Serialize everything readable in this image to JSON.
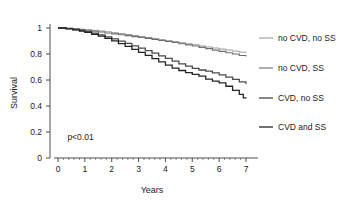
{
  "chart_data": {
    "type": "line",
    "title": "",
    "xlabel": "Years",
    "ylabel": "Survival",
    "xlim": [
      0,
      7.3
    ],
    "ylim": [
      0,
      1.05
    ],
    "grid": false,
    "legend_position": "right",
    "x_ticks": [
      "0",
      "1",
      "2",
      "3",
      "4",
      "5",
      "6",
      "7"
    ],
    "x_tick_values": [
      0,
      1,
      2,
      3,
      4,
      5,
      6,
      7
    ],
    "y_ticks": [
      "0",
      "0.2",
      "0.4",
      "0.6",
      "0.8",
      "1"
    ],
    "y_tick_values": [
      0,
      0.2,
      0.4,
      0.6,
      0.8,
      1
    ],
    "annotations": [
      {
        "text": "p<0.01",
        "x": 0.35,
        "y": 0.135
      }
    ],
    "series": [
      {
        "name": "no CVD, no SS",
        "color": "#9a9a9a",
        "width": 1.0,
        "final_value": 0.81,
        "points": [
          [
            0.0,
            1.0
          ],
          [
            0.3,
            0.998
          ],
          [
            0.55,
            0.995
          ],
          [
            0.8,
            0.991
          ],
          [
            1.0,
            0.987
          ],
          [
            1.25,
            0.982
          ],
          [
            1.5,
            0.977
          ],
          [
            1.75,
            0.971
          ],
          [
            2.0,
            0.964
          ],
          [
            2.25,
            0.957
          ],
          [
            2.5,
            0.95
          ],
          [
            2.75,
            0.943
          ],
          [
            3.0,
            0.935
          ],
          [
            3.25,
            0.927
          ],
          [
            3.5,
            0.919
          ],
          [
            3.75,
            0.911
          ],
          [
            4.0,
            0.903
          ],
          [
            4.25,
            0.895
          ],
          [
            4.5,
            0.887
          ],
          [
            4.75,
            0.879
          ],
          [
            5.0,
            0.871
          ],
          [
            5.25,
            0.862
          ],
          [
            5.5,
            0.854
          ],
          [
            5.75,
            0.846
          ],
          [
            6.0,
            0.838
          ],
          [
            6.25,
            0.83
          ],
          [
            6.5,
            0.822
          ],
          [
            6.75,
            0.814
          ],
          [
            7.0,
            0.81
          ]
        ]
      },
      {
        "name": "no CVD, SS",
        "color": "#6e6e6e",
        "width": 1.1,
        "final_value": 0.78,
        "points": [
          [
            0.0,
            1.0
          ],
          [
            0.3,
            0.997
          ],
          [
            0.55,
            0.993
          ],
          [
            0.8,
            0.988
          ],
          [
            1.0,
            0.983
          ],
          [
            1.25,
            0.976
          ],
          [
            1.5,
            0.969
          ],
          [
            1.75,
            0.962
          ],
          [
            2.0,
            0.955
          ],
          [
            2.25,
            0.948
          ],
          [
            2.5,
            0.941
          ],
          [
            2.75,
            0.934
          ],
          [
            3.0,
            0.927
          ],
          [
            3.25,
            0.92
          ],
          [
            3.5,
            0.912
          ],
          [
            3.75,
            0.904
          ],
          [
            4.0,
            0.896
          ],
          [
            4.25,
            0.888
          ],
          [
            4.5,
            0.879
          ],
          [
            4.75,
            0.87
          ],
          [
            5.0,
            0.861
          ],
          [
            5.25,
            0.851
          ],
          [
            5.5,
            0.841
          ],
          [
            5.75,
            0.83
          ],
          [
            6.0,
            0.82
          ],
          [
            6.25,
            0.81
          ],
          [
            6.5,
            0.8
          ],
          [
            6.75,
            0.789
          ],
          [
            7.0,
            0.78
          ]
        ]
      },
      {
        "name": "CVD, no SS",
        "color": "#4a4a4a",
        "width": 1.3,
        "final_value": 0.57,
        "points": [
          [
            0.0,
            1.0
          ],
          [
            0.3,
            0.995
          ],
          [
            0.55,
            0.988
          ],
          [
            0.8,
            0.98
          ],
          [
            1.0,
            0.972
          ],
          [
            1.25,
            0.96
          ],
          [
            1.5,
            0.947
          ],
          [
            1.75,
            0.932
          ],
          [
            2.0,
            0.916
          ],
          [
            2.25,
            0.899
          ],
          [
            2.5,
            0.881
          ],
          [
            2.75,
            0.863
          ],
          [
            3.0,
            0.845
          ],
          [
            3.25,
            0.826
          ],
          [
            3.5,
            0.806
          ],
          [
            3.75,
            0.786
          ],
          [
            4.0,
            0.766
          ],
          [
            4.25,
            0.745
          ],
          [
            4.5,
            0.724
          ],
          [
            4.75,
            0.706
          ],
          [
            5.0,
            0.69
          ],
          [
            5.25,
            0.677
          ],
          [
            5.5,
            0.668
          ],
          [
            5.75,
            0.655
          ],
          [
            6.0,
            0.64
          ],
          [
            6.25,
            0.622
          ],
          [
            6.5,
            0.605
          ],
          [
            6.75,
            0.586
          ],
          [
            7.0,
            0.57
          ]
        ]
      },
      {
        "name": "CVD and SS",
        "color": "#242424",
        "width": 1.3,
        "final_value": 0.46,
        "points": [
          [
            0.0,
            1.0
          ],
          [
            0.3,
            0.994
          ],
          [
            0.55,
            0.986
          ],
          [
            0.8,
            0.976
          ],
          [
            1.0,
            0.966
          ],
          [
            1.25,
            0.952
          ],
          [
            1.5,
            0.937
          ],
          [
            1.75,
            0.92
          ],
          [
            2.0,
            0.901
          ],
          [
            2.25,
            0.88
          ],
          [
            2.5,
            0.858
          ],
          [
            2.75,
            0.836
          ],
          [
            3.0,
            0.813
          ],
          [
            3.25,
            0.789
          ],
          [
            3.5,
            0.764
          ],
          [
            3.75,
            0.739
          ],
          [
            4.0,
            0.714
          ],
          [
            4.25,
            0.692
          ],
          [
            4.5,
            0.673
          ],
          [
            4.75,
            0.657
          ],
          [
            5.0,
            0.644
          ],
          [
            5.25,
            0.63
          ],
          [
            5.5,
            0.607
          ],
          [
            5.75,
            0.592
          ],
          [
            6.0,
            0.578
          ],
          [
            6.25,
            0.552
          ],
          [
            6.5,
            0.52
          ],
          [
            6.75,
            0.49
          ],
          [
            6.9,
            0.462
          ],
          [
            7.0,
            0.46
          ]
        ]
      }
    ]
  }
}
